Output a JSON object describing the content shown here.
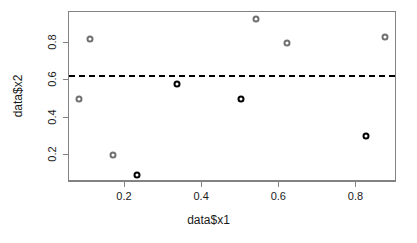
{
  "chart_data": {
    "type": "scatter",
    "title": "",
    "xlabel": "data$x1",
    "ylabel": "data$x2",
    "xlim": [
      0.055,
      0.905
    ],
    "ylim": [
      0.055,
      0.965
    ],
    "grid": false,
    "legend": null,
    "xticks": [
      "0.2",
      "0.4",
      "0.6",
      "0.8"
    ],
    "xtick_values": [
      0.2,
      0.4,
      0.6,
      0.8
    ],
    "yticks": [
      "0.2",
      "0.4",
      "0.6",
      "0.8"
    ],
    "ytick_values": [
      0.2,
      0.4,
      0.6,
      0.8
    ],
    "point_style": {
      "marker": "circle-open-filled-center",
      "size_px": 7,
      "border_px": 2
    },
    "colors": {
      "group_gray": "#707070",
      "group_black": "#000000",
      "axis": "#828282",
      "text": "#1a1a1a",
      "background": "#ffffff",
      "reference_line": "#000000"
    },
    "annotations": [
      {
        "kind": "hline",
        "name": "threshold-line",
        "y": 0.62,
        "style": "dashed",
        "color": "#000000",
        "width_px": 2
      }
    ],
    "points": [
      {
        "x": 0.08,
        "y": 0.5,
        "color": "#707070",
        "group": "gray"
      },
      {
        "x": 0.11,
        "y": 0.82,
        "color": "#707070",
        "group": "gray"
      },
      {
        "x": 0.17,
        "y": 0.2,
        "color": "#707070",
        "group": "gray"
      },
      {
        "x": 0.23,
        "y": 0.09,
        "color": "#000000",
        "group": "black"
      },
      {
        "x": 0.335,
        "y": 0.58,
        "color": "#000000",
        "group": "black"
      },
      {
        "x": 0.5,
        "y": 0.5,
        "color": "#000000",
        "group": "black"
      },
      {
        "x": 0.54,
        "y": 0.93,
        "color": "#707070",
        "group": "gray"
      },
      {
        "x": 0.62,
        "y": 0.8,
        "color": "#707070",
        "group": "gray"
      },
      {
        "x": 0.825,
        "y": 0.3,
        "color": "#000000",
        "group": "black"
      },
      {
        "x": 0.875,
        "y": 0.83,
        "color": "#707070",
        "group": "gray"
      }
    ]
  }
}
